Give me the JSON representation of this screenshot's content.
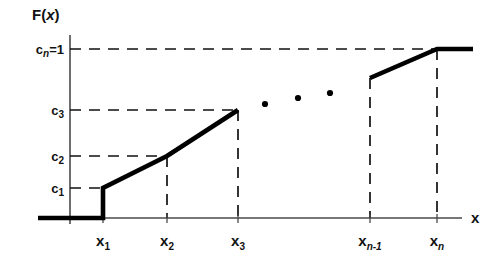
{
  "figure": {
    "title": "",
    "axis_labels": {
      "y_axis_name": "F(x)",
      "y_axis_name_main": "F(",
      "y_axis_name_var": "x",
      "y_axis_name_tail": ")",
      "x_axis_name": "x"
    },
    "ellipsis_note": "•  •  •"
  },
  "chart_data": {
    "type": "line",
    "title": "F(x)",
    "xlabel": "x",
    "ylabel": "F(x)",
    "grid": false,
    "legend": null,
    "xlim": [
      0,
      1
    ],
    "ylim": [
      0,
      1
    ],
    "x_tick_labels": [
      "x₁",
      "x₂",
      "x₃",
      "xₙ₋₁",
      "xₙ"
    ],
    "y_tick_labels": [
      "c₁",
      "c₂",
      "c₃",
      "cₙ=1"
    ],
    "x_ticks": [
      {
        "id": "x1",
        "base": "x",
        "sub": "1",
        "sub_italic": false,
        "px": 103
      },
      {
        "id": "x2",
        "base": "x",
        "sub": "2",
        "sub_italic": false,
        "px": 167
      },
      {
        "id": "x3",
        "base": "x",
        "sub": "3",
        "sub_italic": false,
        "px": 238
      },
      {
        "id": "xn1",
        "base": "x",
        "sub": "n-1",
        "sub_italic": true,
        "px": 370
      },
      {
        "id": "xn",
        "base": "x",
        "sub": "n",
        "sub_italic": true,
        "px": 437
      }
    ],
    "y_ticks": [
      {
        "id": "c1",
        "base": "c",
        "sub": "1",
        "sub_italic": false,
        "suffix": "",
        "px": 188,
        "dash_to": 103
      },
      {
        "id": "c2",
        "base": "c",
        "sub": "2",
        "sub_italic": false,
        "suffix": "",
        "px": 156,
        "dash_to": 167
      },
      {
        "id": "c3",
        "base": "c",
        "sub": "3",
        "sub_italic": false,
        "suffix": "",
        "px": 110,
        "dash_to": 238
      },
      {
        "id": "cn",
        "base": "c",
        "sub": "n",
        "sub_italic": true,
        "suffix": "=1",
        "px": 49,
        "dash_to": 437
      }
    ],
    "series": [
      {
        "name": "F(x)",
        "comment": "baseline zero region, jump at x1, then linear rises",
        "points_px": [
          [
            38,
            218
          ],
          [
            103,
            218
          ],
          [
            103,
            188
          ],
          [
            167,
            156
          ],
          [
            238,
            110
          ]
        ]
      },
      {
        "name": "F(x) tail",
        "comment": "final rise from x_{n-1} to x_n then flat at c_n = 1",
        "points_px": [
          [
            370,
            78
          ],
          [
            437,
            49
          ],
          [
            473,
            49
          ]
        ]
      }
    ],
    "ellipsis_dots_px": [
      [
        265,
        104
      ],
      [
        298,
        98
      ],
      [
        330,
        93
      ]
    ],
    "vertical_droplines_px": [
      {
        "x": 167,
        "y_top": 156,
        "y_bottom": 218
      },
      {
        "x": 238,
        "y_top": 110,
        "y_bottom": 218
      },
      {
        "x": 370,
        "y_top": 78,
        "y_bottom": 218
      },
      {
        "x": 437,
        "y_top": 49,
        "y_bottom": 218
      }
    ],
    "axes_px": {
      "y_axis_x": 70,
      "y_axis_top": 35,
      "y_axis_bottom": 224,
      "x_axis_y": 218,
      "x_axis_left": 38,
      "x_axis_right": 462
    },
    "colors": {
      "curve": "#000000",
      "dash": "#111111",
      "axis": "#4a4a4a",
      "background": "#ffffff"
    }
  }
}
